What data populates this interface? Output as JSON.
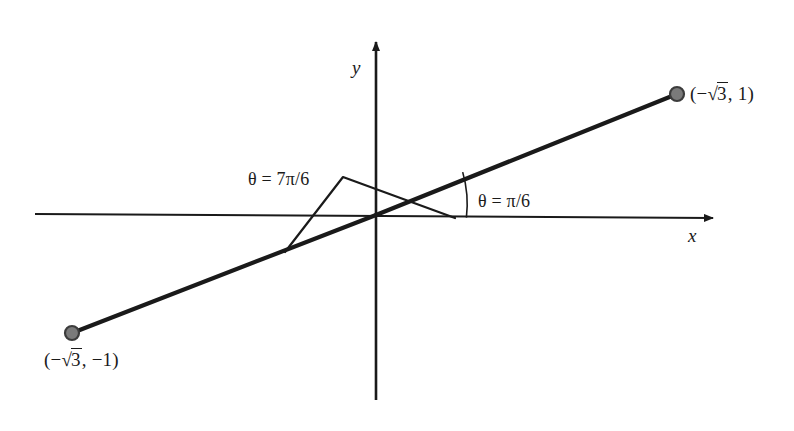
{
  "figure": {
    "background_color": "#ffffff",
    "stroke_color": "#1a1a1a",
    "point_fill_color": "#7a7a7a",
    "point_stroke_color": "#3c3c3c",
    "width": 794,
    "height": 431
  },
  "axes": {
    "x_label": "x",
    "y_label": "y",
    "x_axis": {
      "x1": 35,
      "y1": 214,
      "x2": 722,
      "y2": 218,
      "arrow": "right"
    },
    "y_axis": {
      "x1": 376,
      "y1": 33,
      "x2": 376,
      "y2": 400,
      "arrow": "up"
    },
    "origin": {
      "x": 376,
      "y": 215
    }
  },
  "points": [
    {
      "name": "upper-right-point",
      "label_prefix": "(−",
      "label_radical": "3",
      "label_suffix": ", 1)",
      "label_text": "(−√3, 1)",
      "cx": 677,
      "cy": 94,
      "r": 7,
      "label_x": 690,
      "label_y": 86
    },
    {
      "name": "lower-left-point",
      "label_prefix": "(−",
      "label_radical": "3",
      "label_suffix": ", −1)",
      "label_text": "(−√3, −1)",
      "cx": 72,
      "cy": 333,
      "r": 7,
      "label_x": 44,
      "label_y": 352
    }
  ],
  "rays": [
    {
      "name": "terminal-ray-pi-over-6",
      "description": "thick line from origin through the upper-right point",
      "x1": 376,
      "y1": 215,
      "x2": 677,
      "y2": 94
    },
    {
      "name": "terminal-ray-7pi-over-6",
      "description": "thick line from origin through the lower-left point",
      "x1": 376,
      "y1": 215,
      "x2": 72,
      "y2": 333
    }
  ],
  "angles": [
    {
      "name": "angle-pi-over-6",
      "theta_symbol": "θ",
      "equals": "=",
      "value": "π/6",
      "label_text": "θ = π/6",
      "label_x": 478,
      "label_y": 192,
      "arc_radius": 115,
      "arc_start_deg": 21.9,
      "arc_end_deg": 0
    },
    {
      "name": "angle-7pi-over-6",
      "theta_symbol": "θ",
      "equals": "=",
      "value": "7π/6",
      "label_text": "θ = 7π/6",
      "label_x": 248,
      "label_y": 170,
      "leader_apex": {
        "x": 343,
        "y": 177
      },
      "leader_tail": {
        "x": 285,
        "y": 252
      },
      "leader_tip": {
        "x": 455,
        "y": 218
      }
    }
  ]
}
